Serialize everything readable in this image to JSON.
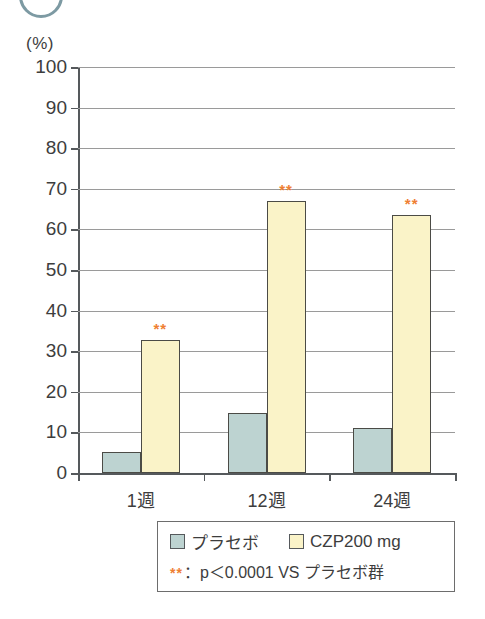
{
  "decoration": {
    "circle_fragment_color": "#7d9aa3"
  },
  "chart_data": {
    "type": "bar",
    "title": "",
    "subtitle": "",
    "xlabel": "",
    "ylabel": "(%)",
    "unit_label": "(%)",
    "ylim": [
      0,
      100
    ],
    "ytick_step": 10,
    "yticks": [
      "0",
      "10",
      "20",
      "30",
      "40",
      "50",
      "60",
      "70",
      "80",
      "90",
      "100"
    ],
    "categories": [
      "1週",
      "12週",
      "24週"
    ],
    "grid": true,
    "legend_position": "bottom-right",
    "series": [
      {
        "name": "プラセボ",
        "color": "#bdd3d1",
        "values": [
          5.2,
          14.8,
          11.2
        ],
        "significance": [
          "",
          "",
          ""
        ]
      },
      {
        "name": "CZP200 mg",
        "color": "#faf3c8",
        "values": [
          32.8,
          67.0,
          63.5
        ],
        "significance": [
          "**",
          "**",
          "**"
        ]
      }
    ],
    "annotations": {
      "significance_mark": "**",
      "significance_color": "#ef8033",
      "footnote": "：p＜0.0001 VS プラセボ群"
    }
  },
  "legend": {
    "items": [
      {
        "label": "プラセボ",
        "swatch": "placebo"
      },
      {
        "label": "CZP200 mg",
        "swatch": "czp"
      }
    ],
    "note_mark": "**",
    "note_text": "：p＜0.0001 VS プラセボ群"
  }
}
